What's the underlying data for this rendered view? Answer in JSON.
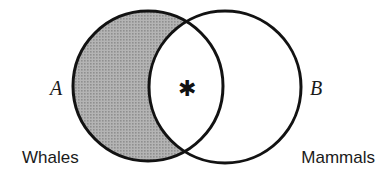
{
  "figure": {
    "background_color": "#ffffff",
    "stroke_color": "#121212",
    "shade_color": "#a8a8a8"
  },
  "sets": {
    "left": {
      "symbol": "A",
      "name": "Whales",
      "fill": "shaded",
      "fill_color": "#a8a8a8",
      "center_x": 148,
      "center_y": 86,
      "radius": 75
    },
    "right": {
      "symbol": "B",
      "name": "Mammals",
      "fill": "white",
      "fill_color": "#ffffff",
      "center_x": 225,
      "center_y": 87,
      "radius": 76
    }
  },
  "intersection": {
    "marker": "✱",
    "marker_name": "asterisk",
    "marker_x": 187,
    "marker_y": 88,
    "fill": "white"
  },
  "labels": {
    "set_a_symbol": "A",
    "set_b_symbol": "B",
    "set_a_name": "Whales",
    "set_b_name": "Mammals"
  }
}
